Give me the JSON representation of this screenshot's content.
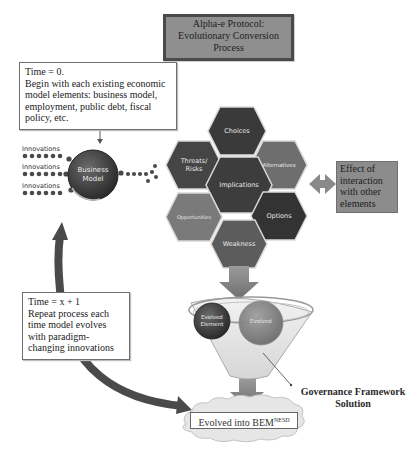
{
  "title": {
    "lines": [
      "Alpha-e Protocol:",
      "Evolutionary Conversion",
      "Process"
    ]
  },
  "start_note": {
    "heading": "Time = 0.",
    "body": "Begin with each existing economic model elements: business model, employment, public debt, fiscal policy, etc."
  },
  "business_model": {
    "label_line1": "Business",
    "label_line2": "Model",
    "innovation_labels": [
      "Innovations",
      "Innovations",
      "Innovations"
    ]
  },
  "hexagons": [
    {
      "id": "choices",
      "label": "Choices",
      "shade": "#3a3a3a"
    },
    {
      "id": "threats",
      "label_line1": "Threats/",
      "label_line2": "Risks",
      "shade": "#454545"
    },
    {
      "id": "alternatives",
      "label": "Alternatives",
      "shade": "#6e6e6e"
    },
    {
      "id": "implications",
      "label": "Implications",
      "shade": "#3d3d3d"
    },
    {
      "id": "opportunities",
      "label": "Opportunities",
      "shade": "#7a7a7a"
    },
    {
      "id": "options",
      "label": "Options",
      "shade": "#333333"
    },
    {
      "id": "weakness",
      "label": "Weakness",
      "shade": "#5c5c5c"
    }
  ],
  "effect_box": {
    "text": "Effect of interaction with other elements"
  },
  "funnel": {
    "left_ball_line1": "Evolved",
    "left_ball_line2": "Element",
    "right_ball_label": "Evolved"
  },
  "governance_label": {
    "line1": "Governance Framework",
    "line2": "Solution"
  },
  "loop_note": {
    "heading": "Time = x + 1",
    "body": "Repeat process each time model evolves with paradigm-changing innovations"
  },
  "result": {
    "text": "Evolved into BEM",
    "superscript": "NESD"
  },
  "colors": {
    "title_fill": "#8f8f8f",
    "title_border": "#4a4a4a",
    "effect_fill": "#8c8c8c",
    "arrow_gray": "#8a8a8a",
    "loop_arrow": "#4a4a4a",
    "cloud": "#e6e6e6"
  }
}
